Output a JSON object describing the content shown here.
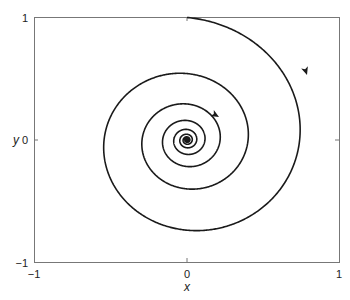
{
  "chart_data": {
    "type": "line",
    "title": "",
    "subtitle": "",
    "xlabel": "x",
    "ylabel": "y",
    "xlim": [
      -1,
      1
    ],
    "ylim": [
      -1,
      1
    ],
    "grid": false,
    "legend": null,
    "xticks": [
      -1,
      0,
      1
    ],
    "yticks": [
      -1,
      0,
      1
    ],
    "xtick_labels": [
      "−1",
      "0",
      "1"
    ],
    "ytick_labels": [
      "−1",
      "0",
      "1"
    ],
    "series": [
      {
        "name": "trajectory",
        "start": [
          0,
          1
        ],
        "end": [
          0,
          0
        ],
        "direction": "clockwise-inward",
        "approx_points": [
          {
            "x": 0.0,
            "y": 1.0
          },
          {
            "x": 0.5,
            "y": 0.78
          },
          {
            "x": 0.84,
            "y": 0.3
          },
          {
            "x": 0.9,
            "y": 0.0
          },
          {
            "x": 0.7,
            "y": -0.5
          },
          {
            "x": 0.25,
            "y": -0.78
          },
          {
            "x": -0.3,
            "y": -0.55
          },
          {
            "x": -0.6,
            "y": 0.0
          },
          {
            "x": -0.4,
            "y": 0.38
          },
          {
            "x": 0.0,
            "y": 0.5
          },
          {
            "x": 0.32,
            "y": 0.28
          },
          {
            "x": 0.38,
            "y": 0.0
          },
          {
            "x": 0.0,
            "y": -0.18
          },
          {
            "x": 0.0,
            "y": 0.0
          }
        ],
        "arrows": [
          {
            "x": 0.87,
            "y": 0.55
          },
          {
            "x": 0.22,
            "y": 0.26
          }
        ]
      }
    ]
  },
  "axes": {
    "x_label": "x",
    "y_label": "y",
    "x_ticks": [
      "−1",
      "0",
      "1"
    ],
    "y_ticks": [
      "−1",
      "0",
      "1"
    ]
  }
}
